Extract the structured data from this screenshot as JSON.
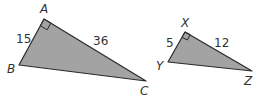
{
  "colors": {
    "fill": "#a3a3a3",
    "stroke": "#2a2a2a",
    "text": "#333333"
  },
  "triangles": [
    {
      "name": "ABC",
      "vertices": {
        "A": {
          "label": "A",
          "x": 44,
          "y": 19
        },
        "B": {
          "label": "B",
          "x": 19,
          "y": 65
        },
        "C": {
          "label": "C",
          "x": 146,
          "y": 81
        }
      },
      "right_angle_at": "A",
      "sides": [
        {
          "between": "AB",
          "label": "15"
        },
        {
          "between": "AC",
          "label": "36"
        }
      ]
    },
    {
      "name": "XYZ",
      "vertices": {
        "X": {
          "label": "X",
          "x": 185,
          "y": 32
        },
        "Y": {
          "label": "Y",
          "x": 168,
          "y": 62
        },
        "Z": {
          "label": "Z",
          "x": 252,
          "y": 71
        }
      },
      "right_angle_at": "X",
      "sides": [
        {
          "between": "XY",
          "label": "5"
        },
        {
          "between": "XZ",
          "label": "12"
        }
      ]
    }
  ]
}
